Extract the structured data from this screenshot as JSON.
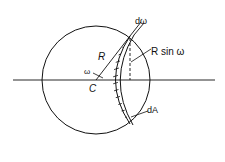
{
  "diagram": {
    "labels": {
      "d_omega": "dω",
      "R": "R",
      "R_sin_omega": "R sin ω",
      "omega": "ω",
      "C": "C",
      "dA": "dA"
    },
    "colors": {
      "stroke": "#111111",
      "background": "#ffffff"
    }
  }
}
